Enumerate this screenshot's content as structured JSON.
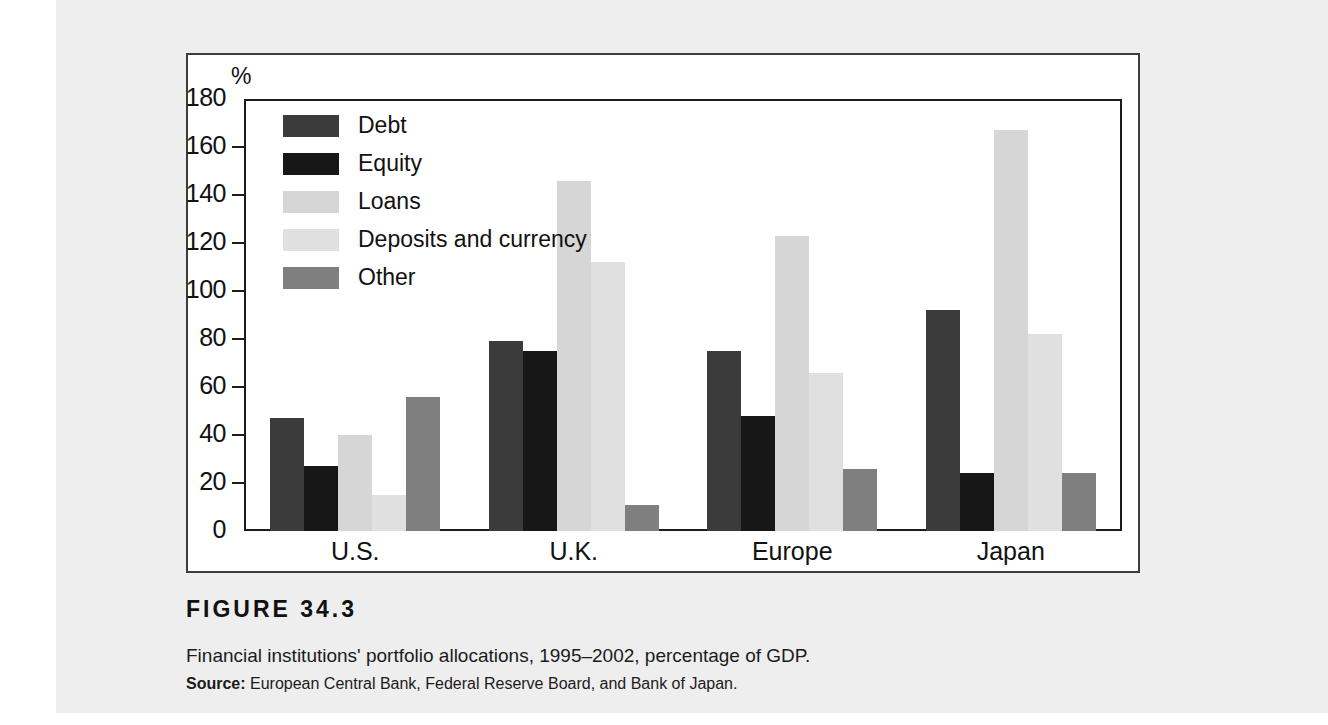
{
  "figure": {
    "number_label": "FIGURE  34.3",
    "caption": "Financial institutions' portfolio allocations, 1995–2002, percentage of GDP.",
    "source_label": "Source:",
    "source_text": " European Central Bank, Federal Reserve Board, and Bank of Japan."
  },
  "chart_data": {
    "type": "bar",
    "title": "",
    "subtitle": "",
    "xlabel": "",
    "ylabel": "%",
    "ylim": [
      0,
      180
    ],
    "yticks": [
      0,
      20,
      40,
      60,
      80,
      100,
      120,
      140,
      160,
      180
    ],
    "ytick_labels": [
      "0",
      "20",
      "40",
      "60",
      "80",
      "100",
      "120",
      "140",
      "160",
      "180"
    ],
    "grid": false,
    "legend_position": "upper-left-inside",
    "categories": [
      "U.S.",
      "U.K.",
      "Europe",
      "Japan"
    ],
    "series": [
      {
        "name": "Debt",
        "color": "#3b3b3b",
        "values": [
          47,
          79,
          75,
          92
        ]
      },
      {
        "name": "Equity",
        "color": "#171717",
        "values": [
          27,
          75,
          48,
          24
        ]
      },
      {
        "name": "Loans",
        "color": "#d6d6d6",
        "values": [
          40,
          146,
          123,
          167
        ]
      },
      {
        "name": "Deposits and currency",
        "color": "#e0e0e0",
        "values": [
          15,
          112,
          66,
          82
        ]
      },
      {
        "name": "Other",
        "color": "#7f7f7f",
        "values": [
          56,
          11,
          26,
          24
        ]
      }
    ]
  }
}
